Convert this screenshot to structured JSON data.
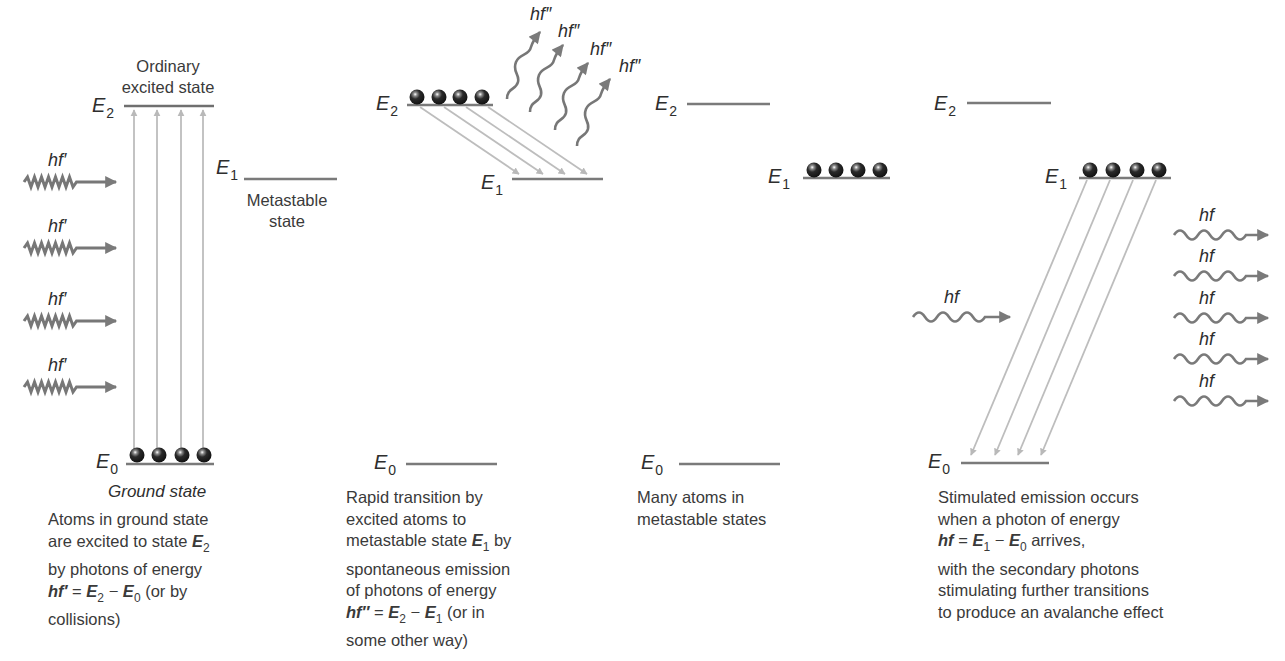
{
  "figure": {
    "colors": {
      "level_line": "#777777",
      "transition_arrow": "#bbbbbb",
      "photon": "#7a7a7a",
      "atom": "#222222",
      "text": "#3a3a3a"
    }
  },
  "panels": [
    {
      "id": "pumping",
      "levels": {
        "E2": {
          "symbol": "E",
          "sub": "2"
        },
        "E1": {
          "symbol": "E",
          "sub": "1"
        },
        "E0": {
          "symbol": "E",
          "sub": "0"
        }
      },
      "top_label_line1": "Ordinary",
      "top_label_line2": "excited state",
      "metastable_line1": "Metastable",
      "metastable_line2": "state",
      "ground_label": "Ground state",
      "photons": [
        "hf′",
        "hf′",
        "hf′",
        "hf′"
      ],
      "atoms_count": 4,
      "atoms_on": "E0",
      "caption": {
        "line1": "Atoms in ground state",
        "line2_a": "are excited to state ",
        "line2_sym": "E",
        "line2_sub": "2",
        "line3": "by photons of energy",
        "eq_lhs": "hf′",
        "eq_mid": " = ",
        "eq_e2": "E",
        "eq_e2_sub": "2",
        "eq_minus": " − ",
        "eq_e0": "E",
        "eq_e0_sub": "0",
        "eq_tail": " (or by",
        "line5": "collisions)"
      }
    },
    {
      "id": "spontaneous-decay",
      "levels": {
        "E2": {
          "symbol": "E",
          "sub": "2"
        },
        "E1": {
          "symbol": "E",
          "sub": "1"
        },
        "E0": {
          "symbol": "E",
          "sub": "0"
        }
      },
      "photons": [
        "hf″",
        "hf″",
        "hf″",
        "hf″"
      ],
      "atoms_count": 4,
      "atoms_on": "E2",
      "caption": {
        "line1": "Rapid transition by",
        "line2": "excited atoms to",
        "line3_a": "metastable state ",
        "line3_sym": "E",
        "line3_sub": "1",
        "line3_tail": " by",
        "line4": "spontaneous emission",
        "line5": "of photons of energy",
        "eq_lhs": "hf″",
        "eq_mid": " = ",
        "eq_e2": "E",
        "eq_e2_sub": "2",
        "eq_minus": " − ",
        "eq_e1": "E",
        "eq_e1_sub": "1",
        "eq_tail": " (or in",
        "line7": "some other way)"
      }
    },
    {
      "id": "population-inversion",
      "levels": {
        "E2": {
          "symbol": "E",
          "sub": "2"
        },
        "E1": {
          "symbol": "E",
          "sub": "1"
        },
        "E0": {
          "symbol": "E",
          "sub": "0"
        }
      },
      "atoms_count": 4,
      "atoms_on": "E1",
      "caption": {
        "line1": "Many atoms in",
        "line2": "metastable states"
      }
    },
    {
      "id": "stimulated-emission",
      "levels": {
        "E2": {
          "symbol": "E",
          "sub": "2"
        },
        "E1": {
          "symbol": "E",
          "sub": "1"
        },
        "E0": {
          "symbol": "E",
          "sub": "0"
        }
      },
      "incoming_photon": "hf",
      "outgoing_photons": [
        "hf",
        "hf",
        "hf",
        "hf",
        "hf"
      ],
      "atoms_count": 4,
      "atoms_on": "E1",
      "caption": {
        "line1": "Stimulated emission occurs",
        "line2": "when a photon of energy",
        "eq_lhs": "hf",
        "eq_mid": " = ",
        "eq_e1": "E",
        "eq_e1_sub": "1",
        "eq_minus": " − ",
        "eq_e0": "E",
        "eq_e0_sub": "0",
        "eq_tail": " arrives,",
        "line4": "with the secondary photons",
        "line5": "stimulating further transitions",
        "line6": "to produce an avalanche effect"
      }
    }
  ]
}
